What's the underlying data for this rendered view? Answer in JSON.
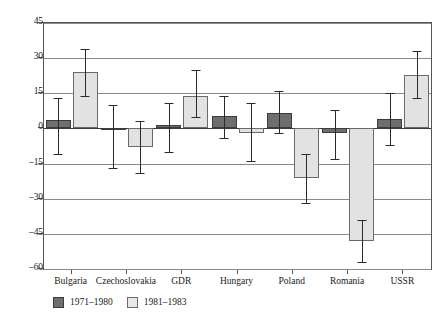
{
  "chart_data": {
    "type": "bar",
    "title": "",
    "subtitle": "",
    "xlabel": "",
    "ylabel": "",
    "ylim": [
      -60,
      45
    ],
    "yticks": [
      45,
      30,
      15,
      0,
      -15,
      -30,
      -45,
      -60
    ],
    "ytick_labels": [
      "45",
      "30",
      "15",
      "0",
      "–15",
      "–30",
      "–45",
      "–60"
    ],
    "grid": true,
    "legend_position": "below-axis-left",
    "error_bars": true,
    "categories": [
      "Bulgaria",
      "Czechoslovakia",
      "GDR",
      "Hungary",
      "Poland",
      "Romania",
      "USSR"
    ],
    "series": [
      {
        "name": "1971–1980",
        "color": "#6e6e6e",
        "values": [
          3.5,
          0.0,
          1.5,
          5.5,
          6.5,
          -2.0,
          4.0
        ],
        "err_low": [
          -11.0,
          -17.0,
          -10.0,
          -4.0,
          -2.0,
          -13.0,
          -7.0
        ],
        "err_high": [
          13.0,
          10.0,
          11.0,
          14.0,
          16.0,
          8.0,
          15.0
        ]
      },
      {
        "name": "1981–1983",
        "color": "#e2e2e2",
        "values": [
          24.0,
          -8.0,
          14.0,
          -2.0,
          -21.0,
          -48.0,
          23.0
        ],
        "err_low": [
          14.0,
          -19.0,
          5.0,
          -14.0,
          -32.0,
          -57.0,
          13.0
        ],
        "err_high": [
          34.0,
          3.0,
          25.0,
          11.0,
          -11.0,
          -39.0,
          33.0
        ]
      }
    ]
  },
  "legend": {
    "entries": [
      {
        "label": "1971–1980"
      },
      {
        "label": "1981–1983"
      }
    ]
  }
}
